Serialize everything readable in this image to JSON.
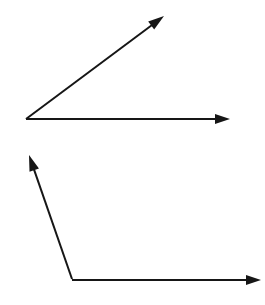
{
  "canvas": {
    "width": 265,
    "height": 305,
    "background_color": "#ffffff",
    "stroke_color": "#161616",
    "stroke_width": 2
  },
  "figures": [
    {
      "id": "acute-angle",
      "name": "Acute angle figure",
      "vertex": {
        "x": 26,
        "y": 119
      },
      "approx_angle_degrees": 37,
      "rays": [
        {
          "id": "acute-horizontal-ray",
          "name": "Horizontal ray pointing right",
          "direction": "right",
          "start": {
            "x": 26,
            "y": 119
          },
          "end": {
            "x": 230,
            "y": 119
          },
          "arrowhead": {
            "length": 15,
            "half_width": 5
          }
        },
        {
          "id": "acute-diagonal-ray",
          "name": "Diagonal ray pointing upper right",
          "direction": "upper-right",
          "start": {
            "x": 26,
            "y": 119
          },
          "end": {
            "x": 164,
            "y": 16
          },
          "arrowhead": {
            "length": 16,
            "half_width": 5
          }
        }
      ]
    },
    {
      "id": "obtuse-angle",
      "name": "Obtuse angle figure",
      "vertex": {
        "x": 72,
        "y": 279
      },
      "approx_angle_degrees": 109,
      "rays": [
        {
          "id": "obtuse-horizontal-ray",
          "name": "Horizontal ray pointing right",
          "direction": "right",
          "start": {
            "x": 72,
            "y": 280
          },
          "end": {
            "x": 261,
            "y": 280
          },
          "arrowhead": {
            "length": 15,
            "half_width": 5
          }
        },
        {
          "id": "obtuse-diagonal-ray",
          "name": "Steep ray pointing upper left",
          "direction": "upper-left",
          "start": {
            "x": 72,
            "y": 279
          },
          "end": {
            "x": 29,
            "y": 155
          },
          "arrowhead": {
            "length": 16,
            "half_width": 5
          }
        }
      ]
    }
  ]
}
